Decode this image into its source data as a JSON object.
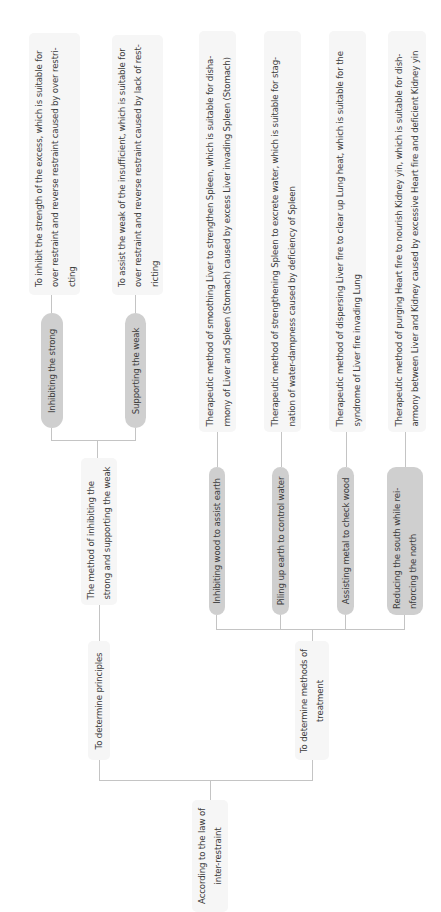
{
  "diagram": {
    "type": "tree",
    "orientation": "rotated-90-ccw",
    "root": {
      "label": "According to the law of inter-restraint",
      "lines": [
        "According to the law of",
        "inter-restraint"
      ]
    },
    "branches": [
      {
        "label": "To determine principles",
        "lines": [
          "To determine principles"
        ],
        "children": [
          {
            "label": "The method of inhibiting the strong and supporting the weak",
            "lines": [
              "The method of inhibiting the",
              "strong and supporting the weak"
            ],
            "children": [
              {
                "label": "Inhibiting the strong",
                "description_lines": [
                  "To inhibit the strength of the excess, which is suitable for",
                  "over restraint and reverse restraint caused by over restri-",
                  "cting"
                ]
              },
              {
                "label": "Supporting the weak",
                "description_lines": [
                  "To assist the weak of the insufficient, which is suitable for",
                  "over restraint and reverse restraint caused by lack of rest-",
                  "ricting"
                ]
              }
            ]
          }
        ]
      },
      {
        "label": "To determine methods of treatment",
        "lines": [
          "To determine methods of",
          "treatment"
        ],
        "children": [
          {
            "label": "Inhibiting wood to assist earth",
            "lines": [
              "Inhibiting wood to assist earth"
            ],
            "description_lines": [
              "Therapeutic method of smoothing Liver to strengthen Spleen, which is suitable for disha-",
              "rmony of Liver and Spleen (Stomach) caused by excess Liver invading Spleen (Stomach)"
            ]
          },
          {
            "label": "Piling up earth to control water",
            "lines": [
              "Piling up earth to control water"
            ],
            "description_lines": [
              "Therapeutic method of strengthening Spleen to excrete water, which is suitable for stag-",
              "nation of water-dampness caused by deficiency of Spleen"
            ]
          },
          {
            "label": "Assisting metal to check wood",
            "lines": [
              "Assisting metal to check wood"
            ],
            "description_lines": [
              "Therapeutic method of dispersing Liver fire to clear up Lung heat, which is suitable for the",
              "syndrome of Liver fire invading Lung"
            ]
          },
          {
            "label": "Reducing the south while reinforcing the north",
            "lines": [
              "Reducing the south while rei-",
              "nforcing the north"
            ],
            "description_lines": [
              "Therapeutic method of purging Heart fire to nourish Kidney yin, which is suitable for dish-",
              "armony between Liver and Kidney caused by excessive Heart fire and deficient Kidney yin"
            ]
          }
        ]
      }
    ]
  },
  "colors": {
    "background": "#ffffff",
    "plain_node": "#f6f6f6",
    "pill_node": "#cfcfcf",
    "connector": "#c4c4c4",
    "text": "#3c3c3c"
  }
}
